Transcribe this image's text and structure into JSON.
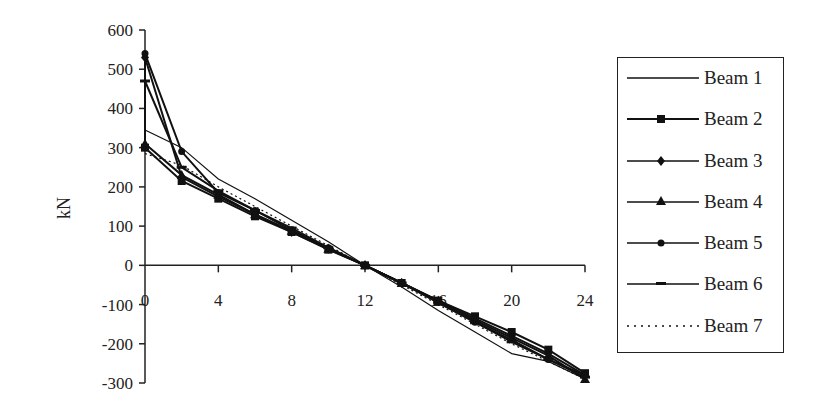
{
  "chart_data": {
    "type": "line",
    "title": "",
    "xlabel": "",
    "ylabel": "kN",
    "xlim": [
      0,
      24
    ],
    "ylim": [
      -300,
      600
    ],
    "x_ticks": [
      0,
      4,
      8,
      12,
      16,
      20,
      24
    ],
    "y_ticks": [
      600,
      500,
      400,
      300,
      200,
      100,
      0,
      -100,
      -200,
      -300
    ],
    "grid": false,
    "legend_position": "right",
    "x": [
      0,
      2,
      4,
      6,
      8,
      10,
      12,
      14,
      16,
      18,
      20,
      22,
      24
    ],
    "series": [
      {
        "name": "Beam 1",
        "marker": "none",
        "style": "solid",
        "values": [
          345,
          300,
          220,
          170,
          115,
          60,
          0,
          -55,
          -115,
          -170,
          -225,
          -245,
          -290
        ]
      },
      {
        "name": "Beam 2",
        "marker": "square",
        "style": "solid",
        "values": [
          300,
          215,
          170,
          125,
          85,
          40,
          0,
          -45,
          -90,
          -130,
          -170,
          -215,
          -275
        ]
      },
      {
        "name": "Beam 3",
        "marker": "diamond",
        "style": "solid",
        "values": [
          530,
          225,
          175,
          130,
          85,
          42,
          0,
          -45,
          -90,
          -135,
          -180,
          -225,
          -280
        ]
      },
      {
        "name": "Beam 4",
        "marker": "triangle",
        "style": "solid",
        "values": [
          310,
          230,
          180,
          130,
          88,
          42,
          0,
          -45,
          -92,
          -140,
          -185,
          -230,
          -290
        ]
      },
      {
        "name": "Beam 5",
        "marker": "circle",
        "style": "solid",
        "values": [
          540,
          290,
          185,
          140,
          90,
          45,
          0,
          -45,
          -95,
          -145,
          -190,
          -240,
          -280
        ]
      },
      {
        "name": "Beam 6",
        "marker": "dash",
        "style": "solid",
        "values": [
          470,
          250,
          190,
          140,
          95,
          45,
          0,
          -45,
          -95,
          -145,
          -195,
          -240,
          -285
        ]
      },
      {
        "name": "Beam 7",
        "marker": "none",
        "style": "dotted",
        "values": [
          285,
          255,
          200,
          150,
          100,
          50,
          0,
          -50,
          -100,
          -150,
          -200,
          -245,
          -290
        ]
      }
    ]
  },
  "legend": {
    "items": [
      {
        "label": "Beam 1"
      },
      {
        "label": "Beam 2"
      },
      {
        "label": "Beam 3"
      },
      {
        "label": "Beam 4"
      },
      {
        "label": "Beam 5"
      },
      {
        "label": "Beam 6"
      },
      {
        "label": "Beam 7"
      }
    ]
  },
  "colors": {
    "line": "#111111",
    "axis": "#222222",
    "background": "#ffffff"
  }
}
